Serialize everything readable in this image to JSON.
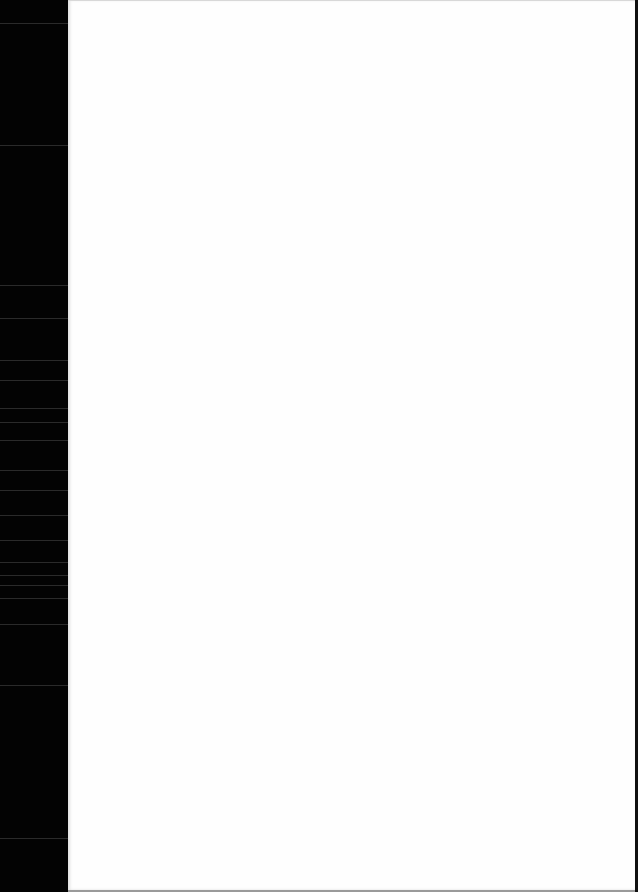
{
  "document": {
    "type": "scanned-page",
    "content": "",
    "colors": {
      "page": "#fefefe",
      "scanner_bed": "#030303",
      "edge": "#111111"
    }
  }
}
